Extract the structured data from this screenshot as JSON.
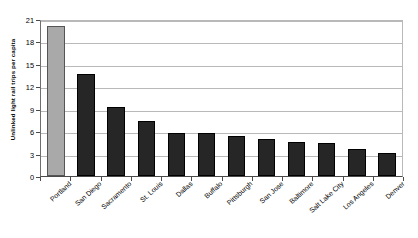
{
  "chart_data": {
    "type": "bar",
    "title": "",
    "xlabel": "",
    "ylabel": "Unlinked light rail trips per capita",
    "ylim": [
      0,
      21
    ],
    "ytick_step": 3,
    "yticks": [
      "0",
      "3",
      "6",
      "9",
      "12",
      "15",
      "18",
      "21"
    ],
    "grid": true,
    "legend": "none",
    "categories": [
      "Portland",
      "San Diego",
      "Sacramento",
      "St. Louis",
      "Dallas",
      "Buffalo",
      "Pittsburgh",
      "San Jose",
      "Baltimore",
      "Salt Lake City",
      "Los Angeles",
      "Denver"
    ],
    "values": [
      20.0,
      13.7,
      9.2,
      7.3,
      5.7,
      5.7,
      5.4,
      5.0,
      4.5,
      4.4,
      3.6,
      3.1
    ],
    "highlight_index": 0,
    "colors": {
      "bar": "#262626",
      "highlight_bar": "#a9a9a9",
      "gridline": "#b9b9b9",
      "axis": "#4a4a4a",
      "background": "#ffffff",
      "text": "#000000"
    }
  }
}
